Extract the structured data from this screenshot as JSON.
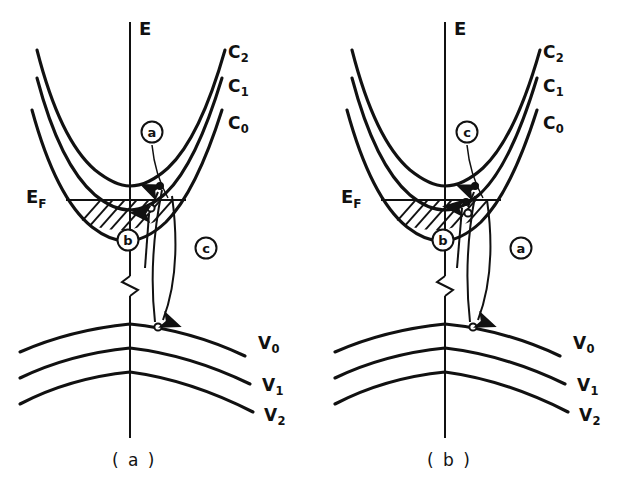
{
  "figure": {
    "type": "band-structure-diagram",
    "stroke_color": "#111111",
    "background_color": "#ffffff"
  },
  "panels": [
    {
      "id": "panel-a",
      "caption": "( a )",
      "energy_axis_label": "E",
      "fermi_label_main": "E",
      "fermi_label_sub": "F",
      "conduction_bands": [
        {
          "label_main": "C",
          "label_sub": "2"
        },
        {
          "label_main": "C",
          "label_sub": "1"
        },
        {
          "label_main": "C",
          "label_sub": "0"
        }
      ],
      "valence_bands": [
        {
          "label_main": "V",
          "label_sub": "0"
        },
        {
          "label_main": "V",
          "label_sub": "1"
        },
        {
          "label_main": "V",
          "label_sub": "2"
        }
      ],
      "transitions": [
        {
          "tag": "a",
          "position": "upper-conduction"
        },
        {
          "tag": "b",
          "position": "lower-left"
        },
        {
          "tag": "c",
          "position": "lower-right"
        }
      ]
    },
    {
      "id": "panel-b",
      "caption": "( b )",
      "energy_axis_label": "E",
      "fermi_label_main": "E",
      "fermi_label_sub": "F",
      "conduction_bands": [
        {
          "label_main": "C",
          "label_sub": "2"
        },
        {
          "label_main": "C",
          "label_sub": "1"
        },
        {
          "label_main": "C",
          "label_sub": "0"
        }
      ],
      "valence_bands": [
        {
          "label_main": "V",
          "label_sub": "0"
        },
        {
          "label_main": "V",
          "label_sub": "1"
        },
        {
          "label_main": "V",
          "label_sub": "2"
        }
      ],
      "transitions": [
        {
          "tag": "c",
          "position": "upper-conduction"
        },
        {
          "tag": "b",
          "position": "lower-left"
        },
        {
          "tag": "a",
          "position": "lower-right"
        }
      ]
    }
  ]
}
